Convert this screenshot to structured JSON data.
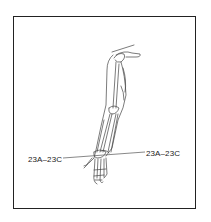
{
  "figure": {
    "type": "anatomical line drawing",
    "labels": [
      {
        "text": "23A–23C",
        "position": "left"
      },
      {
        "text": "23A–23C",
        "position": "right"
      }
    ]
  }
}
